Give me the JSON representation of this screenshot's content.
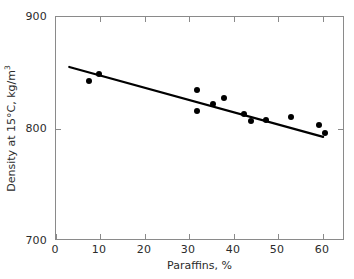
{
  "chart_data": {
    "type": "scatter",
    "title": "",
    "xlabel": "Paraffins, %",
    "ylabel": "Density at 15°C, kg/m",
    "ylabel_superscript": "3",
    "xlim": [
      0,
      65
    ],
    "ylim": [
      700,
      900
    ],
    "grid": false,
    "legend": null,
    "xticks": [
      0,
      10,
      20,
      30,
      40,
      50,
      60
    ],
    "xticklabels": [
      "0",
      "10",
      "20",
      "30",
      "40",
      "50",
      "60"
    ],
    "yticks": [
      700,
      800,
      900
    ],
    "yticklabels": [
      "700",
      "800",
      "900"
    ],
    "marker_color": "#000000",
    "line_color": "#000000",
    "axis_color": "#8a8a8a",
    "background_color": "#ffffff",
    "points": [
      {
        "x": 7.5,
        "y": 843
      },
      {
        "x": 9.7,
        "y": 849
      },
      {
        "x": 31.7,
        "y": 835
      },
      {
        "x": 31.7,
        "y": 816
      },
      {
        "x": 35.3,
        "y": 822
      },
      {
        "x": 37.8,
        "y": 828
      },
      {
        "x": 42.3,
        "y": 813
      },
      {
        "x": 43.8,
        "y": 807
      },
      {
        "x": 47.2,
        "y": 808
      },
      {
        "x": 52.8,
        "y": 811
      },
      {
        "x": 59.1,
        "y": 804
      },
      {
        "x": 60.5,
        "y": 796
      }
    ],
    "series": [
      {
        "name": "Measurements",
        "marker": "filled-circle",
        "x": [
          7.5,
          9.7,
          31.7,
          31.7,
          35.3,
          37.8,
          42.3,
          43.8,
          47.2,
          52.8,
          59.1,
          60.5
        ],
        "values": [
          843,
          849,
          835,
          816,
          822,
          828,
          813,
          807,
          808,
          811,
          804,
          796
        ]
      },
      {
        "name": "Fitted trend line",
        "type": "line",
        "x": [
          3.0,
          60.5
        ],
        "values": [
          855,
          792
        ]
      }
    ],
    "trendline": {
      "x_start": 3.0,
      "y_start": 855,
      "x_end": 60.5,
      "y_end": 792,
      "slope": -1.096,
      "intercept": 858.3
    }
  }
}
